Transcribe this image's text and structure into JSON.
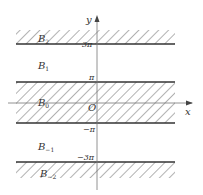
{
  "diagram": {
    "axes": {
      "x_label": "x",
      "y_label": "y",
      "origin_label": "O"
    },
    "tick_labels": {
      "three_pi": "3π",
      "pi": "π",
      "neg_pi": "−π",
      "neg_three_pi": "−3π"
    },
    "regions": [
      {
        "name": "B",
        "sub": "2",
        "hatched": true,
        "range": "y > 3π"
      },
      {
        "name": "B",
        "sub": "1",
        "hatched": false,
        "range": "π < y < 3π"
      },
      {
        "name": "B",
        "sub": "0",
        "hatched": true,
        "range": "−π < y < π"
      },
      {
        "name": "B",
        "sub": "−1",
        "hatched": false,
        "range": "−3π < y < −π"
      },
      {
        "name": "B",
        "sub": "−2",
        "hatched": true,
        "range": "y < −3π"
      }
    ],
    "colors": {
      "line": "#333333",
      "hatch": "#555555",
      "axis": "#777777"
    }
  }
}
